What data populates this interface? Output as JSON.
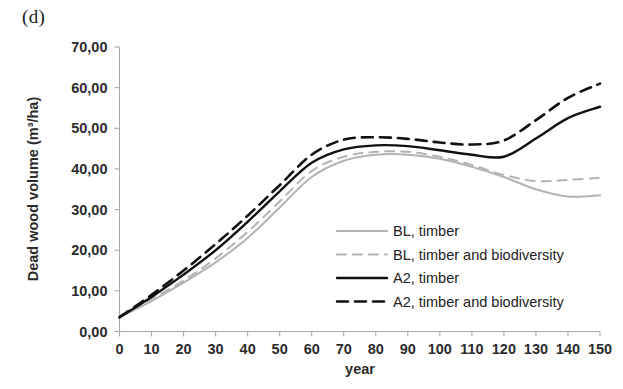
{
  "figure": {
    "panel_label": "(d)",
    "background_color": "#ffffff"
  },
  "chart_data": {
    "type": "line",
    "title": "",
    "subtitle": "",
    "panel": "(d)",
    "xlabel": "year",
    "ylabel": "Dead wood volume (m³/ha)",
    "xlim": [
      0,
      150
    ],
    "ylim": [
      0,
      70
    ],
    "grid": false,
    "legend_position": "inside-center-lower",
    "decimal_separator": ",",
    "ytick_labels": [
      "0,00",
      "10,00",
      "20,00",
      "30,00",
      "40,00",
      "50,00",
      "60,00",
      "70,00"
    ],
    "ytick_values": [
      0,
      10,
      20,
      30,
      40,
      50,
      60,
      70
    ],
    "xtick_labels": [
      "0",
      "10",
      "20",
      "30",
      "40",
      "50",
      "60",
      "70",
      "80",
      "90",
      "100",
      "110",
      "120",
      "130",
      "140",
      "150"
    ],
    "xtick_values": [
      0,
      10,
      20,
      30,
      40,
      50,
      60,
      70,
      80,
      90,
      100,
      110,
      120,
      130,
      140,
      150
    ],
    "x": [
      0,
      10,
      20,
      30,
      40,
      50,
      60,
      70,
      80,
      90,
      100,
      110,
      120,
      130,
      140,
      150
    ],
    "series": [
      {
        "name": "BL, timber",
        "color": "#b3b3b3",
        "style": "solid",
        "width": 2.0,
        "values": [
          3.5,
          7.5,
          12.0,
          17.0,
          23.0,
          30.5,
          38.0,
          42.0,
          43.5,
          43.5,
          42.5,
          40.5,
          38.0,
          35.0,
          33.2,
          33.5
        ]
      },
      {
        "name": "BL, timber and biodiversity",
        "color": "#b3b3b3",
        "style": "dashed",
        "width": 2.0,
        "values": [
          3.5,
          8.0,
          12.5,
          18.0,
          24.5,
          32.0,
          39.5,
          43.0,
          44.2,
          44.2,
          43.0,
          41.0,
          38.5,
          37.0,
          37.3,
          37.8
        ]
      },
      {
        "name": "A2, timber",
        "color": "#111111",
        "style": "solid",
        "width": 2.4,
        "values": [
          3.5,
          8.5,
          14.0,
          20.0,
          27.0,
          34.5,
          41.5,
          44.8,
          45.8,
          45.6,
          44.6,
          43.5,
          43.0,
          47.5,
          52.5,
          55.3
        ]
      },
      {
        "name": "A2, timber and biodiversity",
        "color": "#111111",
        "style": "dashed",
        "width": 2.6,
        "values": [
          3.5,
          9.0,
          15.0,
          21.5,
          28.5,
          36.0,
          43.5,
          47.2,
          47.8,
          47.4,
          46.5,
          46.0,
          47.0,
          52.0,
          57.5,
          61.0
        ]
      }
    ]
  },
  "axes": {
    "y_axis_label": "Dead wood volume (m³/ha)",
    "x_axis_label": "year",
    "axis_color": "#a9a9a9"
  },
  "legend": {
    "items": [
      {
        "label": "BL, timber",
        "color": "#b3b3b3",
        "style": "solid"
      },
      {
        "label": "BL, timber and biodiversity",
        "color": "#b3b3b3",
        "style": "dashed"
      },
      {
        "label": "A2, timber",
        "color": "#111111",
        "style": "solid"
      },
      {
        "label": "A2, timber and biodiversity",
        "color": "#111111",
        "style": "dashed"
      }
    ]
  }
}
